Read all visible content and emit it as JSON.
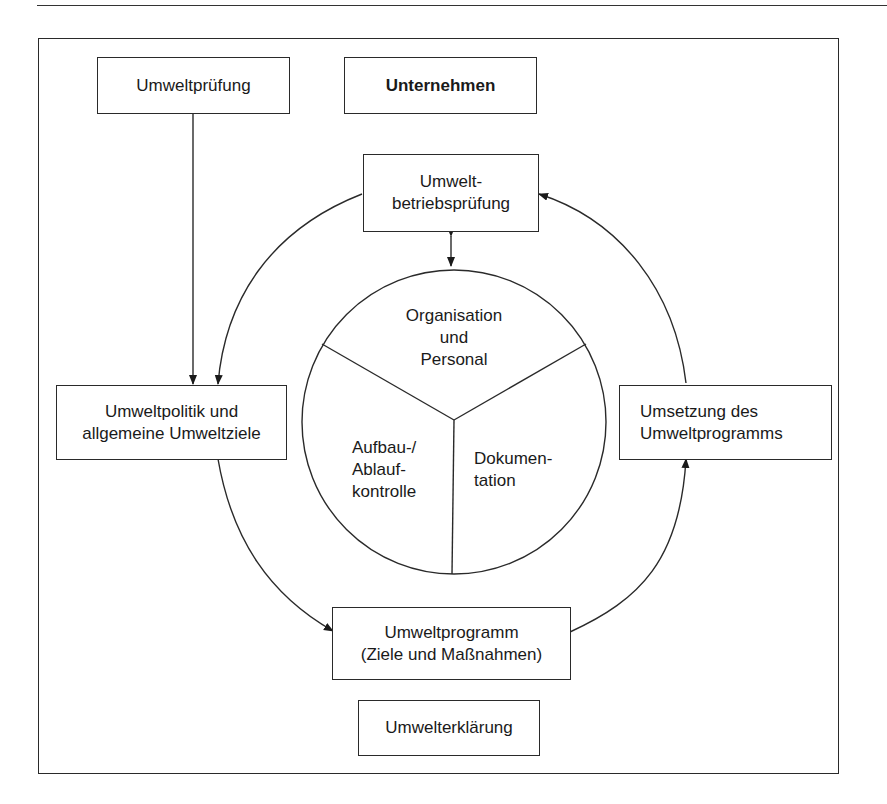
{
  "diagram": {
    "header_rule": true,
    "boxes": {
      "umweltpruefung": "Umweltprüfung",
      "unternehmen": "Unternehmen",
      "betriebspruefung": "Umwelt-\nbetriebsprüfung",
      "umweltpolitik": "Umweltpolitik und\nallgemeine Umweltziele",
      "umsetzung": "Umsetzung des\nUmweltprogramms",
      "umweltprogramm": "Umweltprogramm\n(Ziele und Maßnahmen)",
      "umwelterklaerung": "Umwelterklärung"
    },
    "circle_segments": {
      "top": "Organisation\nund\nPersonal",
      "left": "Aufbau-/\nAblauf-\nkontrolle",
      "right": "Dokumen-\ntation"
    },
    "colors": {
      "line": "#2a2a2a",
      "background": "#ffffff"
    }
  }
}
